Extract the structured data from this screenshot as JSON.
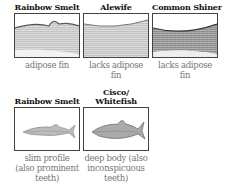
{
  "top_row": [
    {
      "title": "Rainbow Smelt",
      "caption": "adipose fin",
      "image": "fish-closeup-with-adipose-fin"
    },
    {
      "title": "Alewife",
      "caption": "lacks adipose fin",
      "image": "fish-closeup-no-adipose-fin"
    },
    {
      "title": "Common Shiner",
      "caption": "lacks adipose fin",
      "image": "fish-closeup-no-adipose-fin"
    }
  ],
  "bottom_row": [
    {
      "title": "Rainbow Smelt",
      "caption": "slim profile (also prominent teeth)",
      "image": "slim-fish-full-body"
    },
    {
      "title": "Cisco/ Whitefish",
      "caption": "deep body (also inconspicuous teeth)",
      "image": "deep-fish-full-body"
    }
  ]
}
